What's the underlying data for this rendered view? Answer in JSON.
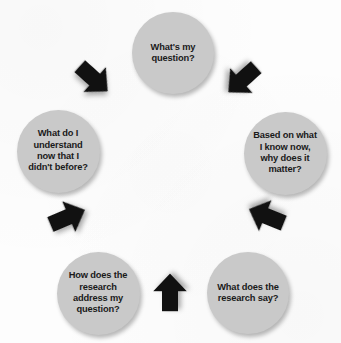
{
  "diagram": {
    "type": "cycle",
    "direction": "clockwise",
    "colors": {
      "node_fill": "#c9c9c9",
      "node_text": "#1a1a1a",
      "arrow_fill": "#111111",
      "background": "#fdfdfd"
    },
    "nodes": [
      {
        "id": "question",
        "label": "What's my\nquestion?",
        "position": "top",
        "cx": 173,
        "cy": 53,
        "diameter": 82
      },
      {
        "id": "significance",
        "label": "Based on what\nI know now,\nwhy does it\nmatter?",
        "position": "right",
        "cx": 285,
        "cy": 153,
        "diameter": 83
      },
      {
        "id": "findings",
        "label": "What does the\nresearch say?",
        "position": "bottom-right",
        "cx": 248,
        "cy": 293,
        "diameter": 82
      },
      {
        "id": "relevance",
        "label": "How does the\nresearch\naddress my\nquestion?",
        "position": "bottom-left",
        "cx": 98,
        "cy": 293,
        "diameter": 83
      },
      {
        "id": "understanding",
        "label": "What do I\nunderstand\nnow that I\ndidn't before?",
        "position": "left",
        "cx": 58,
        "cy": 151,
        "diameter": 83
      }
    ],
    "arrows": [
      {
        "id": "question-to-significance",
        "from": "question",
        "to": "significance",
        "x": 222,
        "y": 60,
        "rotation": 138
      },
      {
        "id": "significance-to-findings",
        "from": "significance",
        "to": "findings",
        "x": 246,
        "y": 196,
        "rotation": 202
      },
      {
        "id": "findings-to-relevance",
        "from": "findings",
        "to": "relevance",
        "x": 150,
        "y": 272,
        "rotation": 270
      },
      {
        "id": "relevance-to-understanding",
        "from": "relevance",
        "to": "understanding",
        "x": 48,
        "y": 197,
        "rotation": 337
      },
      {
        "id": "understanding-to-question",
        "from": "understanding",
        "to": "question",
        "x": 74,
        "y": 59,
        "rotation": 42
      }
    ]
  }
}
